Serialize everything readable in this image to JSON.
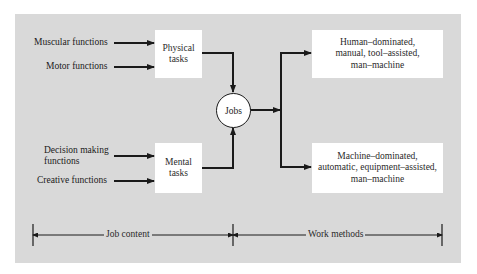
{
  "diagram": {
    "inputs": {
      "physical": [
        "Muscular functions",
        "Motor functions"
      ],
      "mental_line1": "Decision making",
      "mental_line2": "functions",
      "mental_creative": "Creative functions"
    },
    "tasks": {
      "physical": [
        "Physical",
        "tasks"
      ],
      "mental": [
        "Mental",
        "tasks"
      ]
    },
    "center": "Jobs",
    "outputs": {
      "human": [
        "Human–dominated,",
        "manual, tool–assisted,",
        "man–machine"
      ],
      "machine": [
        "Machine–dominated,",
        "automatic, equipment–assisted,",
        "man–machine"
      ]
    },
    "dimensions": {
      "left": "Job content",
      "right": "Work methods"
    },
    "colors": {
      "panel": "#d9d9d9",
      "box": "#ffffff",
      "line": "#1a1a1a"
    }
  }
}
